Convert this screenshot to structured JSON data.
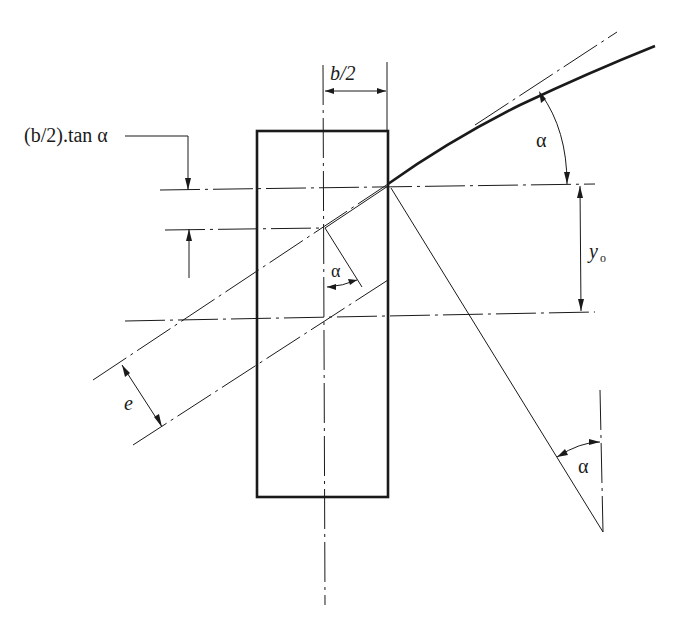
{
  "diagram": {
    "type": "engineering-geometry",
    "labels": {
      "half_width": "b/2",
      "offset_formula": "(b/2).tan α",
      "alpha_top": "α",
      "alpha_center": "α",
      "alpha_bottom": "α",
      "y0_main": "y",
      "y0_sub": "o",
      "eccentricity": "e"
    },
    "colors": {
      "stroke": "#1a1a1a",
      "background": "#ffffff"
    }
  }
}
